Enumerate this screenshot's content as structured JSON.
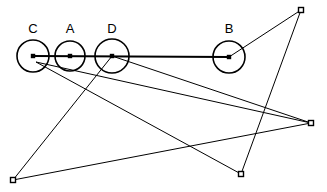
{
  "figure": {
    "background_color": "#ffffff",
    "stroke_color": "#000000",
    "width": 327,
    "height": 192
  },
  "nodes": [
    {
      "id": "C",
      "label": "C",
      "cx": 33,
      "cy": 56,
      "r": 16,
      "label_x": 33,
      "label_y": 33
    },
    {
      "id": "A",
      "label": "A",
      "cx": 70,
      "cy": 56,
      "r": 15,
      "label_x": 70,
      "label_y": 33
    },
    {
      "id": "D",
      "label": "D",
      "cx": 112,
      "cy": 56,
      "r": 17,
      "label_x": 112,
      "label_y": 33
    },
    {
      "id": "B",
      "label": "B",
      "cx": 229,
      "cy": 57,
      "r": 16,
      "label_x": 229,
      "label_y": 33
    }
  ],
  "square_vertices": [
    {
      "id": "P1",
      "x": 301,
      "y": 10,
      "size": 5
    },
    {
      "id": "P2",
      "x": 311,
      "y": 123,
      "size": 5
    },
    {
      "id": "P3",
      "x": 241,
      "y": 174,
      "size": 5
    },
    {
      "id": "P4",
      "x": 13,
      "y": 180,
      "size": 5
    }
  ],
  "edges": [
    {
      "id": "E1",
      "from": "C",
      "to": "B",
      "x1": 33,
      "y1": 56,
      "x2": 229,
      "y2": 57,
      "weight": "thick"
    },
    {
      "id": "E2",
      "from": "B",
      "to": "P1",
      "x1": 229,
      "y1": 57,
      "x2": 301,
      "y2": 10,
      "weight": "thin"
    },
    {
      "id": "E3",
      "from": "P1",
      "to": "P3",
      "x1": 301,
      "y1": 10,
      "x2": 241,
      "y2": 174,
      "weight": "thin"
    },
    {
      "id": "E4",
      "from": "P3",
      "to": "C",
      "x1": 241,
      "y1": 174,
      "x2": 36,
      "y2": 62,
      "weight": "thin"
    },
    {
      "id": "E5",
      "from": "C",
      "to": "P2",
      "x1": 36,
      "y1": 62,
      "x2": 311,
      "y2": 123,
      "weight": "thin"
    },
    {
      "id": "E6",
      "from": "P2",
      "to": "P4",
      "x1": 311,
      "y1": 123,
      "x2": 13,
      "y2": 180,
      "weight": "thin"
    },
    {
      "id": "E7",
      "from": "P4",
      "to": "D",
      "x1": 13,
      "y1": 180,
      "x2": 112,
      "y2": 56,
      "weight": "thin"
    },
    {
      "id": "E8",
      "from": "D",
      "to": "P2",
      "x1": 112,
      "y1": 56,
      "x2": 311,
      "y2": 123,
      "weight": "thin"
    }
  ]
}
